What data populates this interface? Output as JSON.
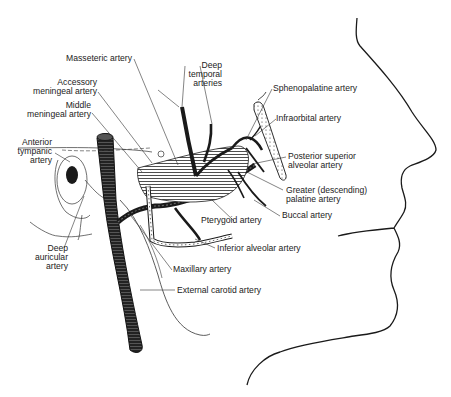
{
  "diagram": {
    "labels": {
      "masseteric": "Masseteric artery",
      "deep_temporal_1": "Deep",
      "deep_temporal_2": "temporal",
      "deep_temporal_3": "arteries",
      "accessory_meningeal_1": "Accessory",
      "accessory_meningeal_2": "meningeal artery",
      "middle_meningeal_1": "Middle",
      "middle_meningeal_2": "meningeal artery",
      "anterior_tympanic_1": "Anterior",
      "anterior_tympanic_2": "tympanic",
      "anterior_tympanic_3": "artery",
      "sphenopalatine": "Sphenopalatine artery",
      "infraorbital": "Infraorbital artery",
      "posterior_superior_alveolar_1": "Posterior superior",
      "posterior_superior_alveolar_2": "alveolar artery",
      "greater_palatine_1": "Greater (descending)",
      "greater_palatine_2": "palatine artery",
      "buccal": "Buccal artery",
      "pterygoid": "Pterygoid artery",
      "inferior_alveolar": "Inferior alveolar artery",
      "deep_auricular_1": "Deep",
      "deep_auricular_2": "auricular",
      "deep_auricular_3": "artery",
      "maxillary": "Maxillary artery",
      "external_carotid": "External carotid artery"
    },
    "colors": {
      "ink": "#1a1a1a",
      "background": "#ffffff"
    }
  }
}
